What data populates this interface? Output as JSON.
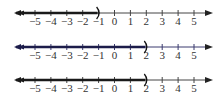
{
  "number_lines": [
    {
      "id": "line-1",
      "y": 13,
      "shaded_from": "-infinity",
      "endpoint": -1,
      "endpoint_symbol": ")",
      "line_color": "#444444",
      "shade_color": "#1a1a1a",
      "label_colors": {
        "-5": "#3a8a3a",
        "-4": "#3a8a3a",
        "-3": "#3a8a3a"
      }
    },
    {
      "id": "line-2",
      "y": 47,
      "shaded_from": "-infinity",
      "endpoint": 2,
      "endpoint_symbol": ")",
      "line_color": "#3a3a6e",
      "shade_color": "#1c1c4a",
      "label_colors": {}
    },
    {
      "id": "line-3",
      "y": 80,
      "shaded_from": "-infinity",
      "endpoint": 2,
      "endpoint_symbol": ")",
      "line_color": "#444444",
      "shade_color": "#1a1a1a",
      "label_colors": {}
    }
  ],
  "ticks": [
    -5,
    -4,
    -3,
    -2,
    -1,
    0,
    1,
    2,
    3,
    4,
    5
  ],
  "tick_labels": [
    "−5",
    "−4",
    "−3",
    "−2",
    "−1",
    "0",
    "1",
    "2",
    "3",
    "4",
    "5"
  ]
}
